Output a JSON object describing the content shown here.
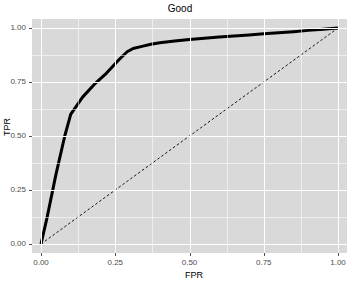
{
  "chart_data": {
    "type": "line",
    "title": "Good",
    "xlabel": "FPR",
    "ylabel": "TPR",
    "xlim": [
      0,
      1
    ],
    "ylim": [
      0,
      1
    ],
    "grid": true,
    "legend": "none",
    "x_ticks": [
      "0.00",
      "0.25",
      "0.50",
      "0.75",
      "1.00"
    ],
    "x_tick_values": [
      0,
      0.25,
      0.5,
      0.75,
      1
    ],
    "y_ticks": [
      "0.00",
      "0.25",
      "0.50",
      "0.75",
      "1.00"
    ],
    "y_tick_values": [
      0,
      0.25,
      0.5,
      0.75,
      1
    ],
    "x_minor_values": [
      0.125,
      0.375,
      0.625,
      0.875
    ],
    "y_minor_values": [
      0.125,
      0.375,
      0.625,
      0.875
    ],
    "series": [
      {
        "name": "ROC curve",
        "style": "solid",
        "color": "#000000",
        "width": 3.0,
        "x": [
          0.0,
          0.02,
          0.05,
          0.08,
          0.1,
          0.14,
          0.18,
          0.22,
          0.26,
          0.29,
          0.31,
          0.34,
          0.37,
          0.4,
          0.45,
          0.5,
          0.55,
          0.6,
          0.65,
          0.7,
          0.75,
          0.8,
          0.85,
          0.9,
          0.95,
          1.0
        ],
        "y": [
          0.0,
          0.12,
          0.32,
          0.5,
          0.6,
          0.68,
          0.74,
          0.79,
          0.85,
          0.89,
          0.905,
          0.915,
          0.925,
          0.932,
          0.94,
          0.947,
          0.953,
          0.958,
          0.963,
          0.968,
          0.973,
          0.978,
          0.983,
          0.989,
          0.994,
          1.0
        ]
      },
      {
        "name": "chance diagonal",
        "style": "dashed",
        "color": "#000000",
        "width": 0.9,
        "x": [
          0.0,
          1.0
        ],
        "y": [
          0.0,
          1.0
        ]
      }
    ],
    "panel_background": "#D9D9D9",
    "grid_color": "#FFFFFF",
    "text_color": "#4D4D4D"
  }
}
